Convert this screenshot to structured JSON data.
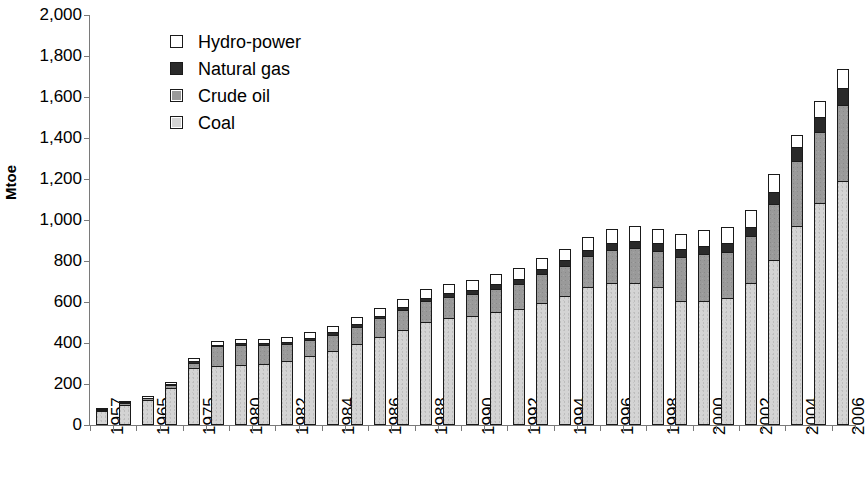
{
  "chart_data": {
    "type": "bar",
    "stacked": true,
    "title": "",
    "xlabel": "",
    "ylabel": "Mtoe",
    "ylim": [
      0,
      2000
    ],
    "ytick_step": 200,
    "ytick_labels": [
      "0",
      "200",
      "400",
      "600",
      "800",
      "1,000",
      "1,200",
      "1,400",
      "1,600",
      "1,800",
      "2,000"
    ],
    "grid": false,
    "legend_position": "top-left",
    "legend": [
      "Hydro-power",
      "Natural gas",
      "Crude oil",
      "Coal"
    ],
    "colors": {
      "hydro_power": "#ffffff",
      "natural_gas": "#2a2a2a",
      "crude_oil": "#9a9a9a",
      "coal": "#d4d4d4",
      "outline": "#1a1a1a",
      "axis": "#7a7a7a"
    },
    "categories": [
      "1957",
      "1960",
      "1965",
      "1970",
      "1975",
      "1978",
      "1980",
      "1981",
      "1982",
      "1983",
      "1984",
      "1985",
      "1986",
      "1987",
      "1988",
      "1989",
      "1990",
      "1991",
      "1992",
      "1993",
      "1994",
      "1995",
      "1996",
      "1997",
      "1998",
      "1999",
      "2000",
      "2001",
      "2002",
      "2003",
      "2004",
      "2005",
      "2006"
    ],
    "tick_labels": [
      "1957",
      "",
      "1965",
      "",
      "1975",
      "",
      "1980",
      "",
      "1982",
      "",
      "1984",
      "",
      "1986",
      "",
      "1988",
      "",
      "1990",
      "",
      "1992",
      "",
      "1994",
      "",
      "1996",
      "",
      "1998",
      "",
      "2000",
      "",
      "2002",
      "",
      "2004",
      "",
      "2006"
    ],
    "series": [
      {
        "name": "Coal",
        "key": "coal",
        "color": "#d4d4d4",
        "values": [
          65,
          95,
          115,
          175,
          275,
          285,
          290,
          295,
          305,
          330,
          355,
          390,
          425,
          460,
          500,
          515,
          525,
          545,
          560,
          590,
          625,
          670,
          690,
          690,
          670,
          600,
          600,
          615,
          690,
          800,
          965,
          1080,
          1185
        ]
      },
      {
        "name": "Crude oil",
        "key": "crude_oil",
        "color": "#9a9a9a",
        "values": [
          5,
          8,
          10,
          15,
          25,
          95,
          95,
          90,
          85,
          80,
          80,
          85,
          90,
          95,
          100,
          105,
          110,
          115,
          125,
          140,
          145,
          150,
          160,
          170,
          175,
          215,
          230,
          225,
          225,
          275,
          320,
          345,
          370
        ]
      },
      {
        "name": "Natural gas",
        "key": "natural_gas",
        "color": "#2a2a2a",
        "values": [
          2,
          3,
          3,
          4,
          5,
          6,
          8,
          9,
          10,
          11,
          12,
          13,
          14,
          15,
          16,
          18,
          20,
          22,
          24,
          26,
          28,
          30,
          32,
          34,
          36,
          38,
          40,
          42,
          45,
          55,
          65,
          75,
          85
        ]
      },
      {
        "name": "Hydro-power",
        "key": "hydro_power",
        "color": "#ffffff",
        "values": [
          3,
          6,
          8,
          12,
          15,
          18,
          20,
          22,
          25,
          27,
          30,
          32,
          35,
          38,
          42,
          45,
          48,
          50,
          52,
          55,
          58,
          62,
          68,
          70,
          72,
          75,
          78,
          80,
          85,
          90,
          60,
          75,
          90
        ]
      }
    ],
    "totals": [
      75,
      112,
      136,
      206,
      320,
      404,
      413,
      416,
      425,
      448,
      477,
      520,
      564,
      608,
      658,
      683,
      703,
      732,
      761,
      811,
      856,
      912,
      950,
      964,
      953,
      928,
      948,
      962,
      1045,
      1220,
      1410,
      1575,
      1730
    ]
  }
}
